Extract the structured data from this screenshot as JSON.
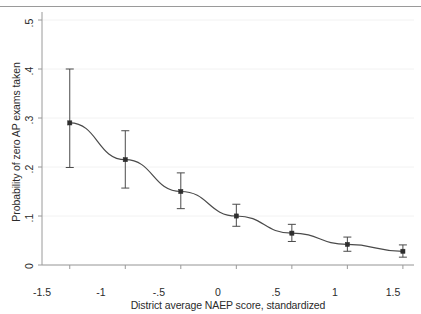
{
  "chart_data": {
    "type": "line",
    "title": "",
    "subtitle": "",
    "xlabel": "District average NAEP score, standardized",
    "ylabel": "Probability of zero AP exams taken",
    "xlim": [
      -1.75,
      1.6
    ],
    "ylim": [
      0,
      0.5
    ],
    "grid": "horizontal",
    "legend": "none",
    "error_bars": "95% confidence interval",
    "xticks": [
      -1.5,
      -1,
      -0.5,
      0,
      0.5,
      1,
      1.5
    ],
    "xtick_labels": [
      "-1.5",
      "-1",
      "-.5",
      "0",
      ".5",
      "1",
      "1.5"
    ],
    "yticks": [
      0,
      0.1,
      0.2,
      0.3,
      0.4,
      0.5
    ],
    "ytick_labels": [
      "0",
      ".1",
      ".2",
      ".3",
      ".4",
      ".5"
    ],
    "x": [
      -1.5,
      -1,
      -0.5,
      0,
      0.5,
      1,
      1.5
    ],
    "values": [
      0.29,
      0.215,
      0.15,
      0.1,
      0.065,
      0.042,
      0.028
    ],
    "ci_low": [
      0.199,
      0.157,
      0.115,
      0.079,
      0.048,
      0.028,
      0.016
    ],
    "ci_high": [
      0.4,
      0.274,
      0.188,
      0.124,
      0.083,
      0.057,
      0.041
    ],
    "series": [
      {
        "name": "Predicted probability",
        "marker": "filled-square",
        "color": "#3c3c3c",
        "values": [
          0.29,
          0.215,
          0.15,
          0.1,
          0.065,
          0.042,
          0.028
        ]
      }
    ],
    "colors": {
      "line": "#4a4a4a",
      "marker": "#2e2e2e",
      "error_bar": "#4a4a4a",
      "axis": "#9a9a9a",
      "grid": "#f2f2f2",
      "text": "#2b2b2b",
      "background": "#ffffff"
    }
  }
}
